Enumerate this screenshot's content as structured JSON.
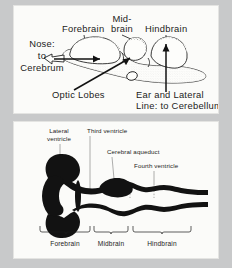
{
  "figure": {
    "name": "fish-brain-anatomy-figure",
    "background_color": "#c8c9ca",
    "panel_color": "#fbfbf9",
    "ink_color": "#121212"
  },
  "top_panel": {
    "name": "lateral-view-of-brain",
    "labels": {
      "forebrain": "Forebrain",
      "midbrain_line1": "Mid-",
      "midbrain_line2": "brain",
      "hindbrain": "Hindbrain",
      "nose_line1": "Nose:",
      "nose_line2": "to",
      "nose_line3": "Cerebrum",
      "optic_lobes": "Optic Lobes",
      "ear_line1": "Ear and Lateral",
      "ear_line2": "Line: to Cerebellum"
    }
  },
  "bottom_panel": {
    "name": "ventricular-system-diagram",
    "labels": {
      "lateral_ventricle_line1": "Lateral",
      "lateral_ventricle_line2": "ventricle",
      "third_ventricle": "Third ventricle",
      "cerebral_aqueduct": "Cerebral aqueduct",
      "fourth_ventricle": "Fourth ventricle"
    },
    "region_braces": [
      {
        "label": "Forebrain"
      },
      {
        "label": "Midbrain"
      },
      {
        "label": "Hindbrain"
      }
    ]
  }
}
